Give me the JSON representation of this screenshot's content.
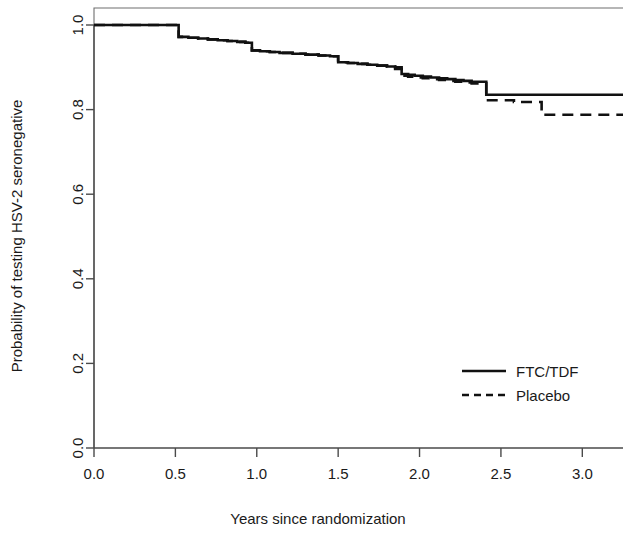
{
  "chart_data": {
    "type": "line",
    "title": "",
    "subtitle": "",
    "xlabel": "Years since randomization",
    "ylabel": "Probability of testing HSV-2 seronegative",
    "xlim": [
      0.0,
      3.25
    ],
    "ylim": [
      0.0,
      1.0
    ],
    "xticks": [
      0.0,
      0.5,
      1.0,
      1.5,
      2.0,
      2.5,
      3.0
    ],
    "xtick_labels": [
      "0.0",
      "0.5",
      "1.0",
      "1.5",
      "2.0",
      "2.5",
      "3.0"
    ],
    "yticks": [
      0.0,
      0.2,
      0.4,
      0.6,
      0.8,
      1.0
    ],
    "ytick_labels": [
      "0.0",
      "0.2",
      "0.4",
      "0.6",
      "0.8",
      "1.0"
    ],
    "grid": false,
    "legend_position": "center-right",
    "step_style": "post",
    "series": [
      {
        "name": "FTC/TDF",
        "line_style": "solid",
        "color": "#111111",
        "x": [
          0.0,
          0.47,
          0.52,
          0.58,
          0.64,
          0.7,
          0.76,
          0.82,
          0.88,
          0.93,
          0.97,
          1.02,
          1.08,
          1.14,
          1.22,
          1.3,
          1.38,
          1.45,
          1.5,
          1.56,
          1.62,
          1.68,
          1.74,
          1.8,
          1.85,
          1.89,
          1.93,
          1.97,
          2.02,
          2.07,
          2.12,
          2.17,
          2.22,
          2.27,
          2.32,
          2.41,
          3.25
        ],
        "y": [
          1.0,
          1.0,
          0.972,
          0.97,
          0.968,
          0.966,
          0.964,
          0.962,
          0.96,
          0.958,
          0.94,
          0.938,
          0.936,
          0.934,
          0.932,
          0.93,
          0.928,
          0.926,
          0.912,
          0.91,
          0.908,
          0.906,
          0.904,
          0.902,
          0.9,
          0.884,
          0.882,
          0.88,
          0.878,
          0.876,
          0.874,
          0.872,
          0.87,
          0.868,
          0.866,
          0.835,
          0.835
        ]
      },
      {
        "name": "Placebo",
        "line_style": "dashed",
        "color": "#111111",
        "x": [
          0.0,
          0.47,
          0.52,
          0.58,
          0.64,
          0.7,
          0.76,
          0.82,
          0.88,
          0.93,
          0.97,
          1.02,
          1.08,
          1.14,
          1.22,
          1.3,
          1.38,
          1.45,
          1.5,
          1.56,
          1.62,
          1.68,
          1.74,
          1.8,
          1.85,
          1.89,
          1.93,
          1.97,
          2.02,
          2.07,
          2.12,
          2.17,
          2.22,
          2.27,
          2.32,
          2.41,
          2.58,
          2.75,
          3.25
        ],
        "y": [
          1.0,
          1.0,
          0.972,
          0.97,
          0.968,
          0.966,
          0.964,
          0.962,
          0.96,
          0.958,
          0.94,
          0.938,
          0.936,
          0.934,
          0.932,
          0.93,
          0.928,
          0.926,
          0.912,
          0.91,
          0.908,
          0.906,
          0.904,
          0.902,
          0.896,
          0.88,
          0.878,
          0.876,
          0.874,
          0.872,
          0.87,
          0.868,
          0.866,
          0.864,
          0.862,
          0.822,
          0.818,
          0.788,
          0.788
        ]
      }
    ]
  },
  "legend": {
    "entries": [
      {
        "label": "FTC/TDF",
        "style": "solid"
      },
      {
        "label": "Placebo",
        "style": "dashed"
      }
    ]
  }
}
